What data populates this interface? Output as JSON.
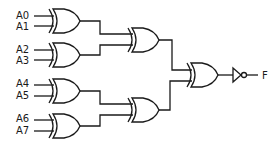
{
  "diagram": {
    "type": "logic-circuit",
    "inputs": [
      {
        "id": "A0",
        "label": "A0"
      },
      {
        "id": "A1",
        "label": "A1"
      },
      {
        "id": "A2",
        "label": "A2"
      },
      {
        "id": "A3",
        "label": "A3"
      },
      {
        "id": "A4",
        "label": "A4"
      },
      {
        "id": "A5",
        "label": "A5"
      },
      {
        "id": "A6",
        "label": "A6"
      },
      {
        "id": "A7",
        "label": "A7"
      }
    ],
    "output": {
      "id": "F",
      "label": "F"
    },
    "gates": [
      {
        "id": "xor1",
        "type": "XOR",
        "inputs": [
          "A0",
          "A1"
        ]
      },
      {
        "id": "xor2",
        "type": "XOR",
        "inputs": [
          "A2",
          "A3"
        ]
      },
      {
        "id": "xor3",
        "type": "XOR",
        "inputs": [
          "A4",
          "A5"
        ]
      },
      {
        "id": "xor4",
        "type": "XOR",
        "inputs": [
          "A6",
          "A7"
        ]
      },
      {
        "id": "xor5",
        "type": "XOR",
        "inputs": [
          "xor1",
          "xor2"
        ]
      },
      {
        "id": "xor6",
        "type": "XOR",
        "inputs": [
          "xor3",
          "xor4"
        ]
      },
      {
        "id": "xor7",
        "type": "XOR",
        "inputs": [
          "xor5",
          "xor6"
        ]
      },
      {
        "id": "not1",
        "type": "NOT",
        "inputs": [
          "xor7"
        ],
        "output": "F"
      }
    ],
    "colors": {
      "stroke": "#1a1a1a",
      "background": "#ffffff"
    }
  }
}
